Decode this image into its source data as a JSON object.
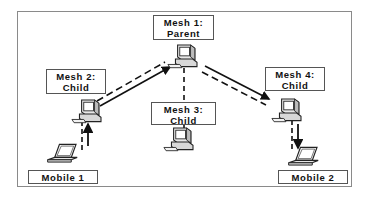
{
  "diagram": {
    "type": "mesh-network-handoff",
    "nodes": [
      {
        "id": "mesh1",
        "label_line1": "Mesh 1:",
        "label_line2": "Parent",
        "device": "desktop-computer"
      },
      {
        "id": "mesh2",
        "label_line1": "Mesh 2:",
        "label_line2": "Child",
        "device": "desktop-computer"
      },
      {
        "id": "mesh3",
        "label_line1": "Mesh 3:",
        "label_line2": "Child",
        "device": "desktop-computer"
      },
      {
        "id": "mesh4",
        "label_line1": "Mesh 4:",
        "label_line2": "Child",
        "device": "desktop-computer"
      },
      {
        "id": "mobile1",
        "label": "Mobile 1",
        "device": "laptop"
      },
      {
        "id": "mobile2",
        "label": "Mobile 2",
        "device": "laptop"
      }
    ],
    "edges": [
      {
        "from": "mobile1",
        "to": "mesh2",
        "style": "solid-arrow+dashed"
      },
      {
        "from": "mesh2",
        "to": "mesh1",
        "style": "solid-arrow+dashed"
      },
      {
        "from": "mesh1",
        "to": "mesh4",
        "style": "solid-arrow+dashed"
      },
      {
        "from": "mesh4",
        "to": "mobile2",
        "style": "solid-arrow+dashed"
      },
      {
        "from": "mesh1",
        "to": "mesh3",
        "style": "dashed"
      }
    ]
  },
  "colors": {
    "line": "#111111",
    "border": "#555555",
    "frame": "#8a8a8a",
    "device_fill": "#e6e6e6",
    "device_stroke": "#222222"
  }
}
